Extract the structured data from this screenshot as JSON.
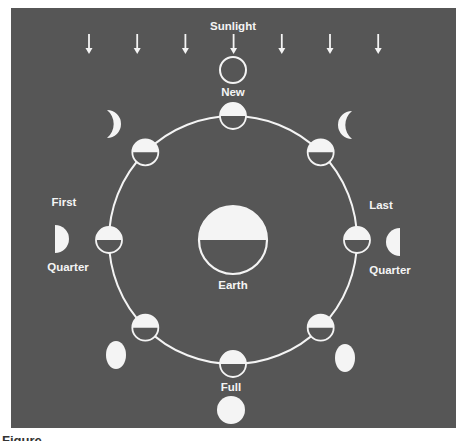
{
  "diagram": {
    "sunlight_label": "Sunlight",
    "sunlight_arrow_count": 7,
    "center_body": {
      "label": "Earth",
      "lit_side": "top"
    },
    "orbit_moons": [
      {
        "id": "new",
        "angle_deg": 90,
        "lit_side": "top"
      },
      {
        "id": "waning-crescent",
        "angle_deg": 45,
        "lit_side": "top"
      },
      {
        "id": "last-quarter",
        "angle_deg": 0,
        "lit_side": "top"
      },
      {
        "id": "waning-gibbous",
        "angle_deg": -45,
        "lit_side": "top"
      },
      {
        "id": "full",
        "angle_deg": -90,
        "lit_side": "top"
      },
      {
        "id": "waxing-gibbous",
        "angle_deg": -135,
        "lit_side": "top"
      },
      {
        "id": "first-quarter",
        "angle_deg": 180,
        "lit_side": "top"
      },
      {
        "id": "waxing-crescent",
        "angle_deg": 135,
        "lit_side": "top"
      }
    ],
    "phase_labels": {
      "new": "New",
      "full": "Full",
      "first_line1": "First",
      "first_line2": "Quarter",
      "last_line1": "Last",
      "last_line2": "Quarter"
    },
    "apparent_phases": [
      {
        "id": "new",
        "appearance": "outline-only"
      },
      {
        "id": "waxing-crescent",
        "appearance": "crescent-lit-right"
      },
      {
        "id": "waning-crescent",
        "appearance": "crescent-lit-left"
      },
      {
        "id": "first-quarter",
        "appearance": "half-lit-right"
      },
      {
        "id": "last-quarter",
        "appearance": "half-lit-left"
      },
      {
        "id": "waxing-gibbous",
        "appearance": "gibbous"
      },
      {
        "id": "waning-gibbous",
        "appearance": "gibbous"
      },
      {
        "id": "full",
        "appearance": "fully-lit"
      }
    ]
  },
  "colors": {
    "background": "#565656",
    "light": "#f4f4f4",
    "dark": "#565656"
  },
  "caption": "Figure"
}
